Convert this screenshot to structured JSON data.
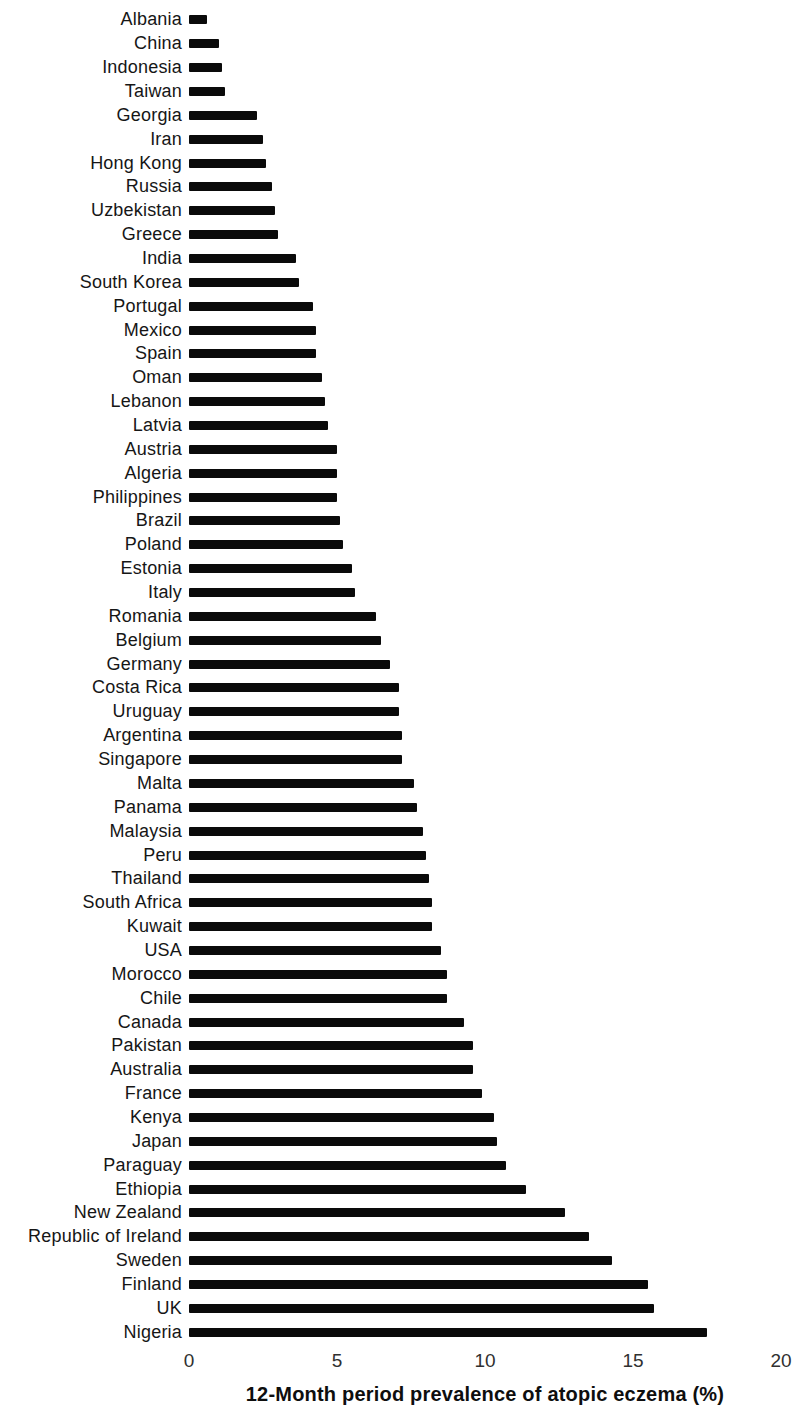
{
  "chart_data": {
    "type": "bar",
    "orientation": "horizontal",
    "title": "",
    "xlabel": "12-Month period prevalence of atopic eczema (%)",
    "ylabel": "",
    "xlim": [
      0,
      20
    ],
    "x_ticks": [
      "0",
      "5",
      "10",
      "15",
      "20"
    ],
    "grid": false,
    "legend": false,
    "bar_color": "#0a0a0a",
    "label_color": "#161616",
    "categories": [
      "Albania",
      "China",
      "Indonesia",
      "Taiwan",
      "Georgia",
      "Iran",
      "Hong Kong",
      "Russia",
      "Uzbekistan",
      "Greece",
      "India",
      "South Korea",
      "Portugal",
      "Mexico",
      "Spain",
      "Oman",
      "Lebanon",
      "Latvia",
      "Austria",
      "Algeria",
      "Philippines",
      "Brazil",
      "Poland",
      "Estonia",
      "Italy",
      "Romania",
      "Belgium",
      "Germany",
      "Costa Rica",
      "Uruguay",
      "Argentina",
      "Singapore",
      "Malta",
      "Panama",
      "Malaysia",
      "Peru",
      "Thailand",
      "South Africa",
      "Kuwait",
      "USA",
      "Morocco",
      "Chile",
      "Canada",
      "Pakistan",
      "Australia",
      "France",
      "Kenya",
      "Japan",
      "Paraguay",
      "Ethiopia",
      "New Zealand",
      "Republic of Ireland",
      "Sweden",
      "Finland",
      "UK",
      "Nigeria"
    ],
    "values": [
      0.6,
      1.0,
      1.1,
      1.2,
      2.3,
      2.5,
      2.6,
      2.8,
      2.9,
      3.0,
      3.6,
      3.7,
      4.2,
      4.3,
      4.3,
      4.5,
      4.6,
      4.7,
      5.0,
      5.0,
      5.0,
      5.1,
      5.2,
      5.5,
      5.6,
      6.3,
      6.5,
      6.8,
      7.1,
      7.1,
      7.2,
      7.2,
      7.6,
      7.7,
      7.9,
      8.0,
      8.1,
      8.2,
      8.2,
      8.5,
      8.7,
      8.7,
      9.3,
      9.6,
      9.6,
      9.9,
      10.3,
      10.4,
      10.7,
      11.4,
      12.7,
      13.5,
      14.3,
      15.5,
      15.7,
      17.5
    ]
  }
}
